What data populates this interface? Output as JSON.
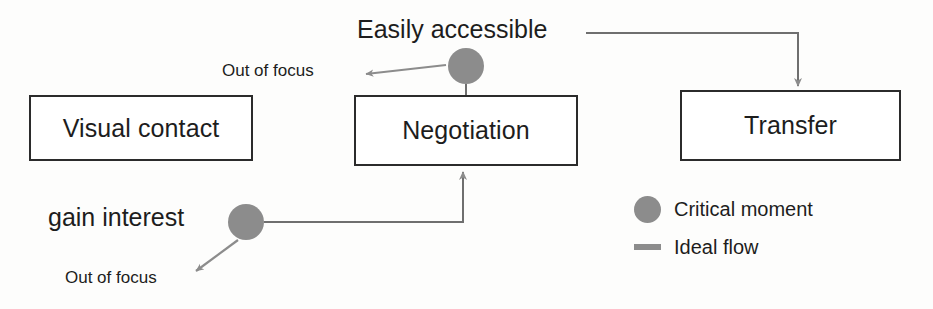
{
  "diagram": {
    "colors": {
      "box_border": "#2b2b2b",
      "box_fill": "#ffffff",
      "text": "#1d1d1d",
      "critical_moment": "#8c8c8c",
      "ideal_flow": "#8c8c8c",
      "background": "#fdfdfc"
    },
    "process_boxes": [
      {
        "id": "visual-contact",
        "label": "Visual contact"
      },
      {
        "id": "negotiation",
        "label": "Negotiation"
      },
      {
        "id": "transfer",
        "label": "Transfer"
      }
    ],
    "critical_moments": [
      {
        "id": "easily-accessible",
        "label": "Easily accessible"
      },
      {
        "id": "gain-interest",
        "label": "gain interest"
      }
    ],
    "annotations": [
      {
        "id": "out-of-focus-top",
        "label": "Out of focus"
      },
      {
        "id": "out-of-focus-bottom",
        "label": "Out of focus"
      }
    ],
    "legend": {
      "items": [
        {
          "marker": "circle-marker",
          "label": "Critical moment"
        },
        {
          "marker": "dash-marker",
          "label": "Ideal flow"
        }
      ]
    },
    "edges": [
      {
        "id": "easily-accessible-to-transfer",
        "from": "easily-accessible",
        "to": "transfer",
        "style": "ideal-flow",
        "arrow": true
      },
      {
        "id": "easily-accessible-to-negotiation",
        "from": "easily-accessible",
        "to": "negotiation",
        "style": "stem",
        "arrow": false
      },
      {
        "id": "easily-accessible-out-of-focus",
        "from": "easily-accessible",
        "to": "out-of-focus-top",
        "style": "out-of-focus",
        "arrow": true
      },
      {
        "id": "gain-interest-to-negotiation",
        "from": "gain-interest",
        "to": "negotiation",
        "style": "ideal-flow",
        "arrow": true
      },
      {
        "id": "gain-interest-out-of-focus",
        "from": "gain-interest",
        "to": "out-of-focus-bottom",
        "style": "out-of-focus",
        "arrow": true
      }
    ]
  }
}
